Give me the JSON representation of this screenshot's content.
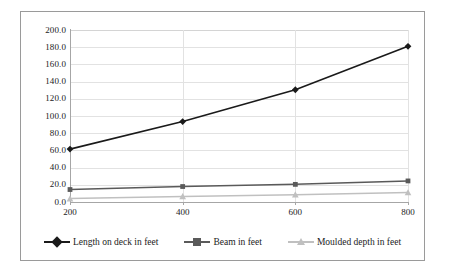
{
  "chart_data": {
    "type": "line",
    "title": "",
    "subtitle": "",
    "xlabel": "",
    "ylabel": "",
    "x": [
      200,
      400,
      600,
      800
    ],
    "categories": [
      "200",
      "400",
      "600",
      "800"
    ],
    "xtick_labels": [
      "200",
      "400",
      "600",
      "800"
    ],
    "ytick_labels": [
      "200.0",
      "180.0",
      "160.0",
      "140.0",
      "120.0",
      "100.0",
      "80.0",
      "60.0",
      "40.0",
      "20.0",
      "0.0"
    ],
    "ytick_values": [
      200,
      180,
      160,
      140,
      120,
      100,
      80,
      60,
      40,
      20,
      0
    ],
    "ylim": [
      0,
      200
    ],
    "xlim": [
      200,
      800
    ],
    "grid": true,
    "grid_axis": "y",
    "legend_position": "bottom",
    "series": [
      {
        "name": "Length on deck in feet",
        "values": [
          61.5,
          93.5,
          130.5,
          181.0
        ],
        "color": "#1a1a1a",
        "marker": "diamond"
      },
      {
        "name": "Beam in feet",
        "values": [
          14.5,
          18.0,
          20.5,
          24.5
        ],
        "color": "#5a5a5a",
        "marker": "square"
      },
      {
        "name": "Moulded depth in feet",
        "values": [
          4.0,
          6.5,
          8.5,
          11.0
        ],
        "color": "#c0c0c0",
        "marker": "triangle"
      }
    ]
  },
  "legend": {
    "items": [
      {
        "label": "Length on deck in feet",
        "icon": "diamond-marker-icon"
      },
      {
        "label": "Beam in feet",
        "icon": "square-marker-icon"
      },
      {
        "label": "Moulded depth in feet",
        "icon": "triangle-marker-icon"
      }
    ]
  },
  "colors": {
    "series_1": "#1a1a1a",
    "series_2": "#5a5a5a",
    "series_3": "#c0c0c0",
    "grid": "#e2e2e2",
    "axis": "#a6a6a6",
    "frame": "#9a9a9a",
    "text": "#1b1b1b",
    "background": "#ffffff"
  }
}
